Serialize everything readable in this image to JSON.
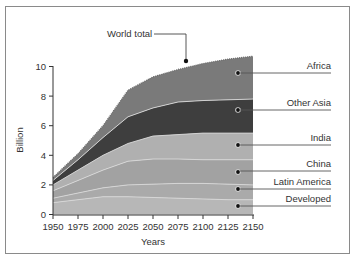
{
  "chart_data": {
    "type": "area",
    "stacked": true,
    "title": "",
    "xlabel": "Years",
    "ylabel": "Billion",
    "x": [
      1950,
      1975,
      2000,
      2025,
      2050,
      2075,
      2100,
      2125,
      2150
    ],
    "xticks": [
      "1950",
      "1975",
      "2000",
      "2025",
      "2050",
      "2075",
      "2100",
      "2125",
      "2150"
    ],
    "yticks": [
      "0",
      "2",
      "4",
      "6",
      "8",
      "10"
    ],
    "ylim": [
      0,
      10.8
    ],
    "xlim": [
      1950,
      2150
    ],
    "grid": false,
    "legend_position": "right, leader-line labels",
    "cumulative_tops": {
      "Developed": [
        0.8,
        1.0,
        1.2,
        1.2,
        1.15,
        1.1,
        1.05,
        1.0,
        1.0
      ],
      "Latin America": [
        1.1,
        1.45,
        1.8,
        2.0,
        2.05,
        2.1,
        2.1,
        2.05,
        2.0
      ],
      "China": [
        1.6,
        2.3,
        3.0,
        3.6,
        3.75,
        3.75,
        3.7,
        3.7,
        3.7
      ],
      "India": [
        2.0,
        3.0,
        4.0,
        4.8,
        5.3,
        5.4,
        5.5,
        5.5,
        5.5
      ],
      "Other Asia": [
        2.3,
        3.7,
        5.2,
        6.6,
        7.2,
        7.6,
        7.7,
        7.75,
        7.8
      ],
      "Africa": [
        2.5,
        4.1,
        6.0,
        8.4,
        9.3,
        9.8,
        10.2,
        10.5,
        10.7
      ]
    },
    "series": [
      {
        "name": "Developed",
        "values": [
          0.8,
          1.0,
          1.2,
          1.2,
          1.15,
          1.1,
          1.05,
          1.0,
          1.0
        ]
      },
      {
        "name": "Latin America",
        "values": [
          0.3,
          0.45,
          0.6,
          0.8,
          0.9,
          1.0,
          1.05,
          1.05,
          1.0
        ]
      },
      {
        "name": "China",
        "values": [
          0.5,
          0.85,
          1.2,
          1.6,
          1.7,
          1.65,
          1.6,
          1.65,
          1.7
        ]
      },
      {
        "name": "India",
        "values": [
          0.4,
          0.7,
          1.0,
          1.2,
          1.55,
          1.65,
          1.8,
          1.8,
          1.8
        ]
      },
      {
        "name": "Other Asia",
        "values": [
          0.3,
          0.7,
          1.2,
          1.8,
          1.9,
          2.2,
          2.2,
          2.25,
          2.3
        ]
      },
      {
        "name": "Africa",
        "values": [
          0.2,
          0.4,
          0.8,
          1.8,
          2.1,
          2.2,
          2.5,
          2.75,
          2.9
        ]
      }
    ],
    "annotations": [
      {
        "text": "World total",
        "x": 2083,
        "y": 10.2
      }
    ]
  },
  "colors": {
    "Developed": "#b7b7b7",
    "Latin America": "#aaaaaa",
    "China": "#a2a2a2",
    "India": "#b0b0b0",
    "Other Asia": "#3e3e3e",
    "Africa": "#7a7a7a",
    "boundary": "#d8d8d8",
    "text": "#333333",
    "frame": "#8a8a8a"
  },
  "labels": {
    "world_total": "World total",
    "regions": [
      "Africa",
      "Other Asia",
      "India",
      "China",
      "Latin America",
      "Developed"
    ]
  }
}
